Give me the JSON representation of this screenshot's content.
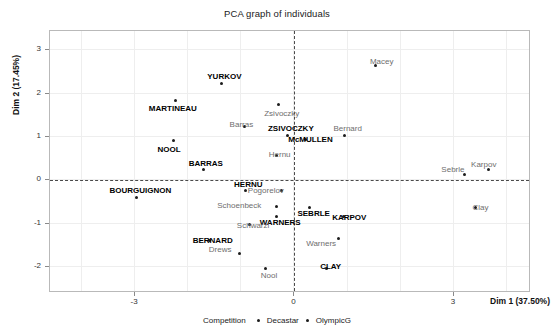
{
  "chart_data": {
    "type": "scatter",
    "title": "PCA graph of individuals",
    "xlabel": "Dim 1 (37.50%)",
    "ylabel": "Dim 2 (17.45%)",
    "xlim": [
      -4.6,
      4.45
    ],
    "ylim": [
      -2.6,
      3.45
    ],
    "xticks": [
      -3,
      0,
      3
    ],
    "yticks": [
      3,
      2,
      1,
      0,
      -1,
      -2
    ],
    "grid": true,
    "legend_position": "bottom",
    "legend_title": "Competition",
    "series": [
      {
        "name": "Decastar",
        "marker_color": "#1c1c1c",
        "label_color": "#000000",
        "label_weight": "bold",
        "points": [
          {
            "label": "YURKOV",
            "x": -1.35,
            "y": 2.22,
            "lx": -1.3,
            "ly": 2.36
          },
          {
            "label": "MARTINEAU",
            "x": -2.22,
            "y": 1.82,
            "lx": -2.27,
            "ly": 1.62
          },
          {
            "label": "NOOL",
            "x": -2.26,
            "y": 0.9,
            "lx": -2.34,
            "ly": 0.68
          },
          {
            "label": "ZSIVOCZKY",
            "x": -0.12,
            "y": 1.02,
            "lx": -0.05,
            "ly": 1.16
          },
          {
            "label": "McMULLEN",
            "x": 0.22,
            "y": 0.92,
            "lx": 0.32,
            "ly": 0.92
          },
          {
            "label": "BARRAS",
            "x": -1.7,
            "y": 0.22,
            "lx": -1.65,
            "ly": 0.35
          },
          {
            "label": "HERNU",
            "x": -0.9,
            "y": -0.26,
            "lx": -0.85,
            "ly": -0.12
          },
          {
            "label": "BOURGUIGNON",
            "x": -2.95,
            "y": -0.42,
            "lx": -2.88,
            "ly": -0.26
          },
          {
            "label": "SEBRLE",
            "x": 0.3,
            "y": -0.66,
            "lx": 0.38,
            "ly": -0.8
          },
          {
            "label": "KARPOV",
            "x": 0.95,
            "y": -0.85,
            "lx": 1.05,
            "ly": -0.88
          },
          {
            "label": "WARNERS",
            "x": -0.32,
            "y": -0.86,
            "lx": -0.25,
            "ly": -1.0
          },
          {
            "label": "BERNARD",
            "x": -1.58,
            "y": -1.42,
            "lx": -1.52,
            "ly": -1.42
          },
          {
            "label": "CLAY",
            "x": 0.62,
            "y": -2.05,
            "lx": 0.7,
            "ly": -2.02
          }
        ]
      },
      {
        "name": "OlympicG",
        "marker_color": "#1c1c1c",
        "label_color": "#6e6e6e",
        "label_weight": "normal",
        "points": [
          {
            "label": "Macey",
            "x": 1.55,
            "y": 2.62,
            "lx": 1.66,
            "ly": 2.7
          },
          {
            "label": "Zsivoczky",
            "x": -0.28,
            "y": 1.72,
            "lx": -0.22,
            "ly": 1.52
          },
          {
            "label": "Barras",
            "x": -0.92,
            "y": 1.22,
            "lx": -0.98,
            "ly": 1.26
          },
          {
            "label": "Bernard",
            "x": 0.96,
            "y": 1.02,
            "lx": 1.02,
            "ly": 1.16
          },
          {
            "label": "Hernu",
            "x": -0.32,
            "y": 0.56,
            "lx": -0.26,
            "ly": 0.56
          },
          {
            "label": "Sebrle",
            "x": 3.22,
            "y": 0.12,
            "lx": 3.0,
            "ly": 0.22
          },
          {
            "label": "Karpov",
            "x": 3.66,
            "y": 0.22,
            "lx": 3.58,
            "ly": 0.34
          },
          {
            "label": "Pogorelov",
            "x": -0.22,
            "y": -0.26,
            "lx": -0.52,
            "ly": -0.26
          },
          {
            "label": "Schoenbeck",
            "x": -0.32,
            "y": -0.62,
            "lx": -1.02,
            "ly": -0.62
          },
          {
            "label": "Clay",
            "x": 3.42,
            "y": -0.66,
            "lx": 3.52,
            "ly": -0.66
          },
          {
            "label": "Schwarzl",
            "x": -0.82,
            "y": -1.05,
            "lx": -0.76,
            "ly": -1.08
          },
          {
            "label": "Warners",
            "x": 0.85,
            "y": -1.36,
            "lx": 0.52,
            "ly": -1.5
          },
          {
            "label": "Drews",
            "x": -1.02,
            "y": -1.72,
            "lx": -1.38,
            "ly": -1.62
          },
          {
            "label": "Nool",
            "x": -0.52,
            "y": -2.06,
            "lx": -0.46,
            "ly": -2.22
          }
        ]
      }
    ]
  }
}
